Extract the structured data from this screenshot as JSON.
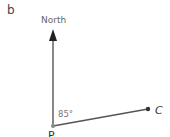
{
  "figure": {
    "part_label": "b",
    "north_label": "North",
    "angle_label": "85°",
    "point_c_label": "C",
    "point_p_label": "P",
    "bearing_degrees": 85
  },
  "colors": {
    "line": "#555555",
    "text": "#555555"
  }
}
